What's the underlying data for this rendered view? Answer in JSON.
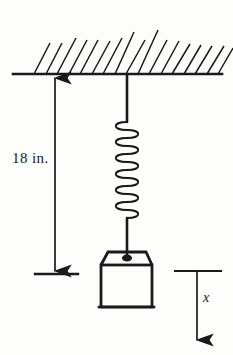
{
  "figure": {
    "kind": "spring-mass-diagram",
    "background_color": "#fdfdfc",
    "ink_color": "#1a1a1a"
  },
  "labels": {
    "dimension": "18 in.",
    "displacement_axis": "x"
  },
  "ceiling": {
    "name": "ceiling-support",
    "line_y": 74,
    "line_x_start": 13,
    "line_x_end": 222,
    "hatch_count": 17,
    "hatch_x_start": 34,
    "hatch_spacing": 11.6,
    "hatch_length": 34,
    "hatch_angle_deg": 62
  },
  "spring": {
    "name": "helical-spring",
    "center_x": 127,
    "top_wire_y_start": 75,
    "coil_top_y": 122,
    "coil_bottom_y": 218,
    "bottom_wire_y_end": 258,
    "coil_count": 12,
    "coil_radius_x": 15,
    "coil_radius_y": 5.2
  },
  "block": {
    "name": "suspended-mass-block",
    "trapezoid_top_left_x": 108,
    "trapezoid_top_right_x": 146,
    "trapezoid_top_y": 252,
    "body_left_x": 101,
    "body_right_x": 152,
    "body_top_y": 265,
    "body_bottom_y": 307,
    "knob_cx": 127,
    "knob_cy": 258,
    "knob_rx": 5,
    "knob_ry": 3.5
  },
  "dimension": {
    "name": "equilibrium-dimension",
    "arrow_x": 55,
    "arrow_top_y": 78,
    "arrow_bottom_y": 272,
    "reference_line_y": 274,
    "reference_line_x_start": 35,
    "reference_line_x_end": 78
  },
  "displacement": {
    "name": "displacement-axis",
    "reference_line_y": 271,
    "reference_line_x_start": 175,
    "reference_line_x_end": 221,
    "arrow_x": 197,
    "arrow_top_y": 271,
    "arrow_bottom_y": 341
  }
}
